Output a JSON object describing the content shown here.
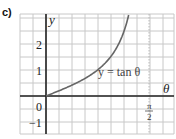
{
  "panel": {
    "label": "c)"
  },
  "chart_data": {
    "type": "line",
    "title": "",
    "xlabel": "θ",
    "ylabel": "y",
    "function": "y = tan θ",
    "curve_label": "y = tan θ",
    "x_tick_labels": [
      "π/2"
    ],
    "x_ticks": [
      1.5708
    ],
    "y_tick_labels": [
      "−1",
      "0",
      "1",
      "2"
    ],
    "y_ticks": [
      -1,
      0,
      1,
      2
    ],
    "origin_label": "0",
    "xlim": [
      -0.4,
      1.95
    ],
    "ylim": [
      -1.5,
      3.15
    ],
    "grid": true,
    "asymptote": {
      "x": 1.5708,
      "style": "dotted"
    },
    "series": [
      {
        "name": "y = tan θ",
        "x": [
          0,
          0.2,
          0.4,
          0.6,
          0.8,
          1.0,
          1.1,
          1.2,
          1.264
        ],
        "y": [
          0,
          0.203,
          0.423,
          0.684,
          1.03,
          1.557,
          1.965,
          2.572,
          3.15
        ]
      }
    ],
    "colors": {
      "curve": "#666666",
      "axes": "#222222",
      "grid": "#c8c8c8"
    }
  }
}
